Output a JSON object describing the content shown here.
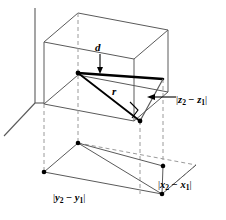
{
  "figure": {
    "type": "3d-geometry-diagram",
    "labels": {
      "d": "d",
      "r": "r",
      "z_difference": "|z₂ − z₁|",
      "x_difference": "|x₂ − x₁|",
      "y_difference": "|y₂ − y₁|"
    },
    "label_parts": {
      "z": {
        "open": "|",
        "var_a": "z",
        "sub_a": "2",
        "op": "−",
        "var_b": "z",
        "sub_b": "1",
        "close": "|"
      },
      "x": {
        "open": "|",
        "var_a": "x",
        "sub_a": "2",
        "op": "−",
        "var_b": "x",
        "sub_b": "1",
        "close": "|"
      },
      "y": {
        "open": "|",
        "var_a": "y",
        "sub_a": "2",
        "op": "−",
        "var_b": "y",
        "sub_b": "1",
        "close": "|"
      }
    },
    "colors": {
      "line": "#5a5a5a",
      "heavy_line": "#000000",
      "dashed_line": "#9a9a9a",
      "background": "#ffffff",
      "vertex": "#000000"
    },
    "geometry": {
      "axes": {
        "vertical": {
          "x1": 35,
          "y1": 8,
          "x2": 35,
          "y2": 103
        },
        "diagonal": {
          "x1": 35,
          "y1": 103,
          "x2": 4,
          "y2": 136
        }
      },
      "box_top_face": [
        {
          "x": 44,
          "y": 42
        },
        {
          "x": 78,
          "y": 13
        },
        {
          "x": 168,
          "y": 30
        },
        {
          "x": 134,
          "y": 59
        }
      ],
      "box_bottom_face": [
        {
          "x": 44,
          "y": 104
        },
        {
          "x": 78,
          "y": 75
        },
        {
          "x": 168,
          "y": 92
        },
        {
          "x": 134,
          "y": 121
        }
      ],
      "segment_d": {
        "x1": 78,
        "y1": 73,
        "x2": 163,
        "y2": 79
      },
      "segment_r": {
        "x1": 78,
        "y1": 73,
        "x2": 140,
        "y2": 121
      },
      "segment_z": {
        "x1": 163,
        "y1": 79,
        "x2": 140,
        "y2": 121
      },
      "arrow_z": {
        "x1": 178,
        "y1": 97,
        "x2": 150,
        "y2": 97
      },
      "arrow_d": {
        "x1": 100,
        "y1": 55,
        "x2": 100,
        "y2": 70
      },
      "base_parallelogram": [
        {
          "x": 44,
          "y": 172
        },
        {
          "x": 78,
          "y": 143
        },
        {
          "x": 196,
          "y": 165
        },
        {
          "x": 162,
          "y": 194
        }
      ],
      "base_vertices": [
        {
          "x": 44,
          "y": 172
        },
        {
          "x": 78,
          "y": 143
        },
        {
          "x": 162,
          "y": 194
        },
        {
          "x": 163,
          "y": 166
        }
      ],
      "dashed_verticals": [
        {
          "x": 44,
          "y1": 104,
          "y2": 172
        },
        {
          "x": 78,
          "y1": 13,
          "y2": 143
        },
        {
          "x": 163,
          "y1": 79,
          "y2": 166
        },
        {
          "x": 140,
          "y1": 121,
          "y2": 194
        }
      ]
    }
  }
}
